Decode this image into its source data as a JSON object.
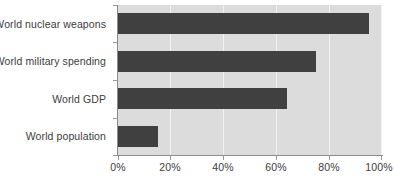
{
  "chart_data": {
    "type": "bar",
    "orientation": "horizontal",
    "title": "",
    "subtitle": "",
    "xlabel": "",
    "ylabel": "",
    "categories": [
      "World nuclear weapons",
      "World military spending",
      "World GDP",
      "World population"
    ],
    "values": [
      95,
      75,
      64,
      15
    ],
    "value_unit": "%",
    "xlim": [
      0,
      100
    ],
    "xticks": [
      0,
      20,
      40,
      60,
      80,
      100
    ],
    "xtick_labels": [
      "0%",
      "20%",
      "40%",
      "60%",
      "80%",
      "100%"
    ],
    "grid": "vertical",
    "legend": "none",
    "series": [
      {
        "name": "Share of world total",
        "values": [
          95,
          75,
          64,
          15
        ]
      }
    ],
    "colors": {
      "bar": "#404040",
      "plot_background": "#dcdcdc",
      "gridline": "#f2f2f2",
      "axis_line": "#8c8c8c",
      "text": "#3c3c3c",
      "page_background": "#ffffff"
    }
  }
}
